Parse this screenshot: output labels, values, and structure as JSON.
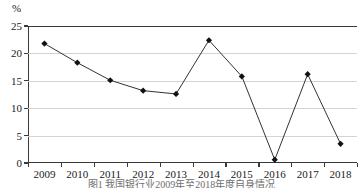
{
  "chart_data": {
    "type": "line",
    "title": "",
    "caption": "图1 我国银行业2009年至2018年度自身情况",
    "xlabel": "",
    "ylabel": "%",
    "unit_label": "%",
    "categories": [
      "2009",
      "2010",
      "2011",
      "2012",
      "2013",
      "2014",
      "2015",
      "2016",
      "2017",
      "2018"
    ],
    "values": [
      21.8,
      18.3,
      15.1,
      13.2,
      12.6,
      22.4,
      15.8,
      0.6,
      16.2,
      3.5
    ],
    "ylim": [
      0,
      25
    ],
    "yticks": [
      0,
      5,
      10,
      15,
      20,
      25
    ],
    "ytick_labels": [
      "0",
      "5",
      "10",
      "15",
      "20",
      "25"
    ],
    "grid": true,
    "grid_axis": "y",
    "legend": false,
    "legend_position": "none",
    "marker": "diamond",
    "marker_color": "#111111",
    "line_color": "#333333"
  },
  "axis": {
    "unit": "%",
    "y_min_label": "0",
    "y_max_label": "25"
  }
}
